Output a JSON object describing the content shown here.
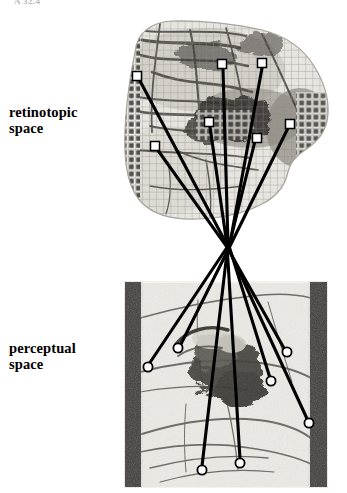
{
  "figure": {
    "title_fragment": "A 32.4",
    "labels": {
      "retinotopic": "retinotopic\nspace",
      "perceptual": "perceptual\nspace"
    },
    "colors": {
      "ink": "#000000",
      "paper": "#ffffff",
      "marker_fill": "#ffffff",
      "marker_stroke": "#000000",
      "bar_dark": "#3d3a36",
      "mesh": "#8d8d8d",
      "tissue_mid": "#b9b4ac",
      "tissue_dark": "#4a4640"
    }
  },
  "panels": [
    {
      "id": "retinotopic-panel",
      "label": "retinotopic space",
      "marker_shape": "square",
      "description": "grid-warped cortical surface image with mesh overlay",
      "bounds": {
        "x": 118,
        "y": 18,
        "width": 212,
        "height": 222
      }
    },
    {
      "id": "perceptual-panel",
      "label": "perceptual space",
      "marker_shape": "circle",
      "description": "photographic scene framed by two dark vertical bars",
      "bounds": {
        "x": 124,
        "y": 281,
        "width": 204,
        "height": 207
      }
    }
  ],
  "markers": {
    "retinotopic_squares": [
      {
        "id": "r1",
        "x": 137,
        "y": 76,
        "size": 9
      },
      {
        "id": "r2",
        "x": 222,
        "y": 64,
        "size": 9
      },
      {
        "id": "r3",
        "x": 262,
        "y": 63,
        "size": 9
      },
      {
        "id": "r4",
        "x": 209,
        "y": 122,
        "size": 9
      },
      {
        "id": "r5",
        "x": 290,
        "y": 124,
        "size": 9
      },
      {
        "id": "r6",
        "x": 257,
        "y": 138,
        "size": 9
      },
      {
        "id": "r7",
        "x": 155,
        "y": 146,
        "size": 9
      }
    ],
    "perceptual_circles": [
      {
        "id": "p1",
        "x": 148,
        "y": 367,
        "r": 4.6
      },
      {
        "id": "p2",
        "x": 178,
        "y": 348,
        "r": 4.6
      },
      {
        "id": "p3",
        "x": 287,
        "y": 352,
        "r": 4.6
      },
      {
        "id": "p4",
        "x": 271,
        "y": 381,
        "r": 4.6
      },
      {
        "id": "p5",
        "x": 309,
        "y": 423,
        "r": 4.6
      },
      {
        "id": "p6",
        "x": 202,
        "y": 470,
        "r": 4.6
      },
      {
        "id": "p7",
        "x": 240,
        "y": 463,
        "r": 4.6
      }
    ]
  },
  "correspondences": [
    {
      "id": "link-1",
      "from": "r1",
      "to": "p5",
      "note": "upper-left square to far-right circle"
    },
    {
      "id": "link-2",
      "from": "r2",
      "to": "p6",
      "note": "top-centre square to bottom-left circle"
    },
    {
      "id": "link-3",
      "from": "r3",
      "to": "p1",
      "note": "top-right square to left circle"
    },
    {
      "id": "link-4",
      "from": "r4",
      "to": "p7",
      "note": "mid square to bottom-centre circle"
    },
    {
      "id": "link-5",
      "from": "r5",
      "to": "p2",
      "note": "right square to upper-left circle"
    },
    {
      "id": "link-6",
      "from": "r6",
      "to": "p4",
      "note": "mid-right square to right circle"
    },
    {
      "id": "link-7",
      "from": "r7",
      "to": "p3",
      "note": "lower-left square to upper-right circle"
    }
  ],
  "crossing": {
    "x": 228,
    "y": 246,
    "note": "lines converge and cross between the two panels"
  }
}
